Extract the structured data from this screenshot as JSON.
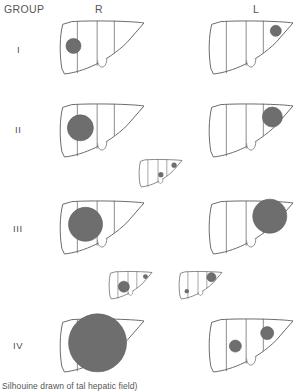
{
  "figure": {
    "title_visible": false,
    "caption": "Silhouine drawn of tal hepatic field)",
    "headers": {
      "group_col": "GROUP",
      "right_col": "R",
      "left_col": "L"
    },
    "colors": {
      "outline": "#5a5a5a",
      "segment_line": "#6a6a6a",
      "nodule_fill": "#6e6e6e",
      "background": "#ffffff",
      "text": "#4d4d4d"
    },
    "group_labels": [
      "I",
      "II",
      "III",
      "IV"
    ]
  },
  "chart_data": {
    "type": "diagram",
    "title": "",
    "xlabel": "",
    "ylabel": "",
    "legend": [],
    "rows": [
      {
        "group": "I",
        "label_y": 50,
        "panels": [
          {
            "side": "R",
            "scale": "large",
            "x": 58,
            "y": 20,
            "w": 86,
            "h": 54,
            "nodules": [
              {
                "cx": 0.18,
                "cy": 0.48,
                "r_px": 7.5,
                "size": "medium"
              }
            ]
          },
          {
            "side": "L",
            "scale": "large",
            "x": 207,
            "y": 20,
            "w": 86,
            "h": 54,
            "nodules": [
              {
                "cx": 0.8,
                "cy": 0.2,
                "r_px": 5.5,
                "size": "small"
              }
            ]
          }
        ]
      },
      {
        "group": "II",
        "label_y": 130,
        "panels": [
          {
            "side": "R",
            "scale": "large",
            "x": 58,
            "y": 103,
            "w": 86,
            "h": 54,
            "nodules": [
              {
                "cx": 0.26,
                "cy": 0.46,
                "r_px": 13,
                "size": "large"
              }
            ]
          },
          {
            "side": "L",
            "scale": "large",
            "x": 207,
            "y": 103,
            "w": 86,
            "h": 54,
            "nodules": [
              {
                "cx": 0.76,
                "cy": 0.26,
                "r_px": 10,
                "size": "large"
              }
            ]
          },
          {
            "side": "inset-R",
            "scale": "small",
            "x": 138,
            "y": 159,
            "w": 44,
            "h": 28,
            "nodules": [
              {
                "cx": 0.82,
                "cy": 0.22,
                "r_px": 2.6,
                "size": "tiny"
              },
              {
                "cx": 0.52,
                "cy": 0.56,
                "r_px": 2.6,
                "size": "tiny"
              }
            ]
          }
        ]
      },
      {
        "group": "III",
        "label_y": 228,
        "panels": [
          {
            "side": "R",
            "scale": "large",
            "x": 58,
            "y": 200,
            "w": 86,
            "h": 54,
            "nodules": [
              {
                "cx": 0.32,
                "cy": 0.45,
                "r_px": 17,
                "size": "x-large"
              }
            ]
          },
          {
            "side": "L",
            "scale": "large",
            "x": 207,
            "y": 200,
            "w": 86,
            "h": 54,
            "nodules": [
              {
                "cx": 0.73,
                "cy": 0.3,
                "r_px": 17,
                "size": "x-large"
              }
            ]
          },
          {
            "side": "inset-R",
            "scale": "small",
            "x": 108,
            "y": 271,
            "w": 44,
            "h": 28,
            "nodules": [
              {
                "cx": 0.36,
                "cy": 0.56,
                "r_px": 5.5,
                "size": "small"
              },
              {
                "cx": 0.85,
                "cy": 0.2,
                "r_px": 2.4,
                "size": "tiny"
              }
            ]
          },
          {
            "side": "inset-L",
            "scale": "small",
            "x": 178,
            "y": 271,
            "w": 44,
            "h": 28,
            "nodules": [
              {
                "cx": 0.76,
                "cy": 0.22,
                "r_px": 4.5,
                "size": "small"
              },
              {
                "cx": 0.2,
                "cy": 0.72,
                "r_px": 2.2,
                "size": "tiny"
              }
            ]
          }
        ]
      },
      {
        "group": "IV",
        "label_y": 345,
        "panels": [
          {
            "side": "R",
            "scale": "large",
            "x": 58,
            "y": 318,
            "w": 86,
            "h": 54,
            "nodules": [
              {
                "cx": 0.46,
                "cy": 0.46,
                "r_px": 29,
                "size": "xx-large"
              }
            ]
          },
          {
            "side": "L",
            "scale": "large",
            "x": 207,
            "y": 318,
            "w": 86,
            "h": 54,
            "nodules": [
              {
                "cx": 0.33,
                "cy": 0.52,
                "r_px": 6,
                "size": "medium"
              },
              {
                "cx": 0.7,
                "cy": 0.28,
                "r_px": 6.5,
                "size": "medium"
              }
            ]
          }
        ]
      }
    ]
  }
}
